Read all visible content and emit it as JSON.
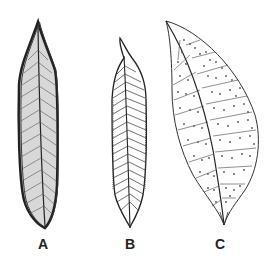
{
  "figure": {
    "leaves": [
      {
        "id": "A",
        "label": "A",
        "style": "narrow lanceolate, dark shaded margin, dense parallel veins"
      },
      {
        "id": "B",
        "label": "B",
        "style": "narrow lanceolate, curved tip, pinnate veins"
      },
      {
        "id": "C",
        "label": "C",
        "style": "broad elliptic-ovate, acuminate tip, pinnate veins with dotted glands"
      }
    ],
    "colors": {
      "ink": "#222222",
      "shade": "#555555",
      "background": "#ffffff"
    }
  }
}
